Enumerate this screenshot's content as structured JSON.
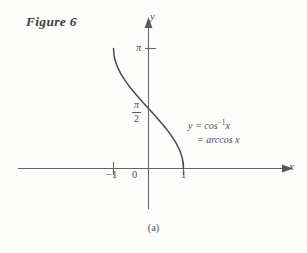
{
  "figure": {
    "label": "Figure 6",
    "caption": "(a)"
  },
  "chart_data": {
    "type": "line",
    "title": "",
    "xlabel": "x",
    "ylabel": "y",
    "xlim": [
      -1.55,
      1.85
    ],
    "ylim": [
      -0.75,
      3.55
    ],
    "grid": false,
    "legend": "none",
    "annotations": [
      {
        "line1": "y = cos",
        "exponent": "-1",
        "line1_var": " x",
        "line2": "= arccos x"
      }
    ],
    "xticks": [
      -1,
      0,
      1
    ],
    "xtick_labels": [
      "-1",
      "0",
      "1"
    ],
    "yticks": [
      1.5708,
      3.14159
    ],
    "ytick_labels": [
      "π/2",
      "π"
    ],
    "series": [
      {
        "name": "y = arccos x",
        "x": [
          -1.0,
          -0.98,
          -0.95,
          -0.9,
          -0.8,
          -0.7,
          -0.6,
          -0.5,
          -0.4,
          -0.3,
          -0.2,
          -0.1,
          0.0,
          0.1,
          0.2,
          0.3,
          0.4,
          0.5,
          0.6,
          0.7,
          0.8,
          0.9,
          0.95,
          0.98,
          1.0
        ],
        "y": [
          3.1416,
          2.9415,
          2.8198,
          2.6906,
          2.4981,
          2.3462,
          2.2143,
          2.0944,
          1.9823,
          1.8755,
          1.7722,
          1.671,
          1.5708,
          1.4706,
          1.3694,
          1.2661,
          1.1593,
          1.0472,
          0.9273,
          0.7954,
          0.6435,
          0.451,
          0.3176,
          0.2003,
          0.0
        ]
      }
    ]
  },
  "axes": {
    "y_label": "y",
    "x_label": "x",
    "tick_pi": "π",
    "tick_pi_over_two_numerator": "π",
    "tick_pi_over_two_denominator": "2",
    "tick_zero": "0",
    "tick_neg_one": "−1",
    "tick_one": "1"
  },
  "annotation": {
    "line1_prefix": "y = cos",
    "line1_exponent": "−1",
    "line1_suffix": "x",
    "line2": "= arccos x"
  },
  "colors": {
    "stroke": "#575757",
    "curve": "#4a4a4a",
    "text": "#4d4d4d",
    "background": "#fdfdfc"
  }
}
